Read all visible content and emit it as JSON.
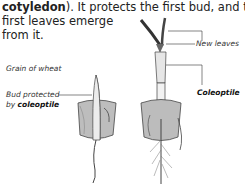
{
  "text": {
    "line1_bold": "cotyledon",
    "line1_rest": "). It protects the first bud, and the",
    "line2": "first leaves emerge",
    "line3": "from it."
  },
  "figure": {
    "left": {
      "caption": "Grain of wheat",
      "label_line1": "Bud protected",
      "label_line2_prefix": "by ",
      "label_line2_bold": "coleoptile"
    },
    "right": {
      "label_new_leaves": "New leaves",
      "label_coleoptile": "Coleoptile"
    }
  }
}
